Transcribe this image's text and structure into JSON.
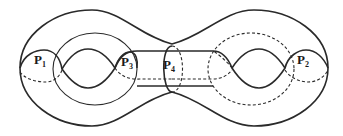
{
  "diagram": {
    "type": "genus-2 surface with curves",
    "labels": [
      {
        "id": "P1",
        "main": "P",
        "sub": "1"
      },
      {
        "id": "P2",
        "main": "P",
        "sub": "2"
      },
      {
        "id": "P3",
        "main": "P",
        "sub": "3"
      },
      {
        "id": "P4",
        "main": "P",
        "sub": "4"
      }
    ],
    "colors": {
      "stroke": "#2a2a2a",
      "background": "#ffffff"
    }
  }
}
